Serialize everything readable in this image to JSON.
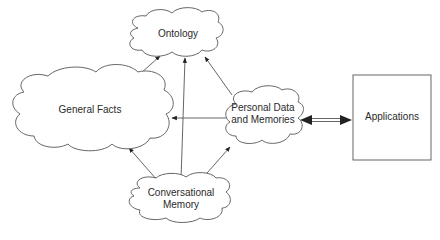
{
  "diagram": {
    "nodes": [
      {
        "id": "ontology",
        "label": "Ontology",
        "shape": "cloud"
      },
      {
        "id": "general_facts",
        "label": "General Facts",
        "shape": "cloud"
      },
      {
        "id": "personal_data",
        "label_line1": "Personal Data",
        "label_line2": "and Memories",
        "shape": "cloud"
      },
      {
        "id": "conversational_memory",
        "label_line1": "Conversational",
        "label_line2": "Memory",
        "shape": "cloud"
      },
      {
        "id": "applications",
        "label": "Applications",
        "shape": "rectangle"
      }
    ],
    "edges": [
      {
        "from": "general_facts",
        "to": "ontology",
        "type": "arrow"
      },
      {
        "from": "conversational_memory",
        "to": "ontology",
        "type": "arrow"
      },
      {
        "from": "personal_data",
        "to": "ontology",
        "type": "arrow"
      },
      {
        "from": "personal_data",
        "to": "general_facts",
        "type": "arrow"
      },
      {
        "from": "conversational_memory",
        "to": "general_facts",
        "type": "arrow"
      },
      {
        "from": "conversational_memory",
        "to": "personal_data",
        "type": "arrow"
      },
      {
        "from": "personal_data",
        "to": "applications",
        "type": "bidirectional-double-arrow"
      }
    ],
    "colors": {
      "stroke": "#555555",
      "arrowhead": "#222222",
      "text": "#2a2a2a",
      "background": "#ffffff"
    }
  }
}
